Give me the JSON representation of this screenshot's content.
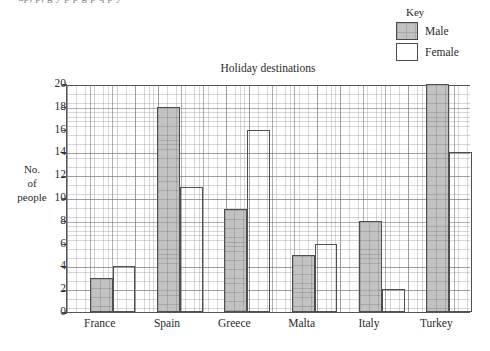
{
  "top_clipped_text": "up, p, g y p p g p q p y",
  "legend": {
    "title": "Key",
    "items": [
      {
        "label": "Male",
        "color": "#c2c2c2",
        "name": "male"
      },
      {
        "label": "Female",
        "color": "#ffffff",
        "name": "female"
      }
    ]
  },
  "axis_label_lines": [
    "No.",
    "of",
    "people"
  ],
  "chart_data": {
    "type": "bar",
    "title": "Holiday destinations",
    "xlabel": "",
    "ylabel": "No. of people",
    "categories": [
      "France",
      "Spain",
      "Greece",
      "Malta",
      "Italy",
      "Turkey"
    ],
    "series": [
      {
        "name": "Male",
        "color": "#c2c2c2",
        "values": [
          3,
          18,
          9,
          5,
          8,
          20
        ]
      },
      {
        "name": "Female",
        "color": "#ffffff",
        "values": [
          4,
          11,
          16,
          6,
          2,
          14
        ]
      }
    ],
    "ylim": [
      0,
      20
    ],
    "ytick_step": 2,
    "yticks": [
      0,
      2,
      4,
      6,
      8,
      10,
      12,
      14,
      16,
      18,
      20
    ],
    "grid": true,
    "grid_style": "graph-paper",
    "legend_position": "top-right"
  }
}
